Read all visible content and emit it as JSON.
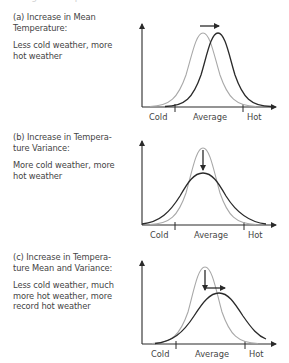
{
  "header": {
    "cut_off_text": "Change in Temperature Distribution"
  },
  "panels": [
    {
      "id": "a",
      "title": "(a) Increase in Mean Temperature:",
      "title_lines": [
        "(a) Increase in Mean",
        "Temperature:"
      ],
      "description_lines": [
        "Less cold weather, more",
        "hot weather"
      ],
      "axis_labels": {
        "cold": "Cold",
        "average": "Average",
        "hot": "Hot"
      }
    },
    {
      "id": "b",
      "title": "(b) Increase in Temperature Variance:",
      "title_lines": [
        "(b) Increase in Tempera-",
        "ture Variance:"
      ],
      "description_lines": [
        "More cold weather, more",
        "hot weather"
      ],
      "axis_labels": {
        "cold": "Cold",
        "average": "Average",
        "hot": "Hot"
      }
    },
    {
      "id": "c",
      "title": "(c) Increase in Temperature Mean and Variance:",
      "title_lines": [
        "(c) Increase in Tempera-",
        "ture Mean and Variance:"
      ],
      "description_lines": [
        "Less cold weather, much",
        "more hot weather, more",
        "record hot weather"
      ],
      "axis_labels": {
        "cold": "Cold",
        "average": "Average",
        "hot": "Hot"
      }
    }
  ],
  "colors": {
    "original_curve": "#a8a8a8",
    "shifted_curve": "#2a2a2a",
    "axis": "#2a2a2a",
    "text": "#444444"
  }
}
